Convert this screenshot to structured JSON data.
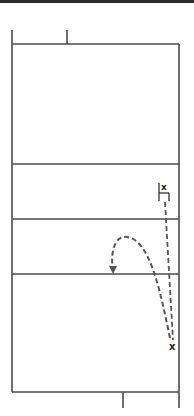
{
  "diagram": {
    "title": "",
    "type": "volleyball-court-play",
    "colors": {
      "lines": "#4a4a4a",
      "path": "#555555",
      "marker": "#222222",
      "topbar": "#2a2a2a"
    },
    "players": [
      {
        "id": "player-1",
        "label": "x",
        "position": "front-right",
        "note": "blocker stance bracket"
      },
      {
        "id": "player-2",
        "label": "x",
        "position": "back-right"
      }
    ],
    "paths": [
      {
        "id": "straight-run",
        "style": "dashed",
        "from": "player-1",
        "to": "player-2"
      },
      {
        "id": "curved-ball-arrow",
        "style": "dashed",
        "from": "player-2",
        "to": "center-court",
        "arrowhead": true
      }
    ]
  }
}
